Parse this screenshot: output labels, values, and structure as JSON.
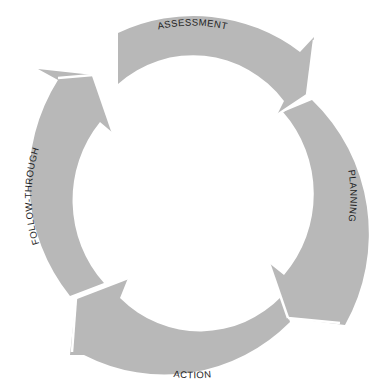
{
  "diagram": {
    "type": "cycle",
    "direction": "clockwise",
    "colors": {
      "segment": "#b8b8b8",
      "background": "#ffffff",
      "text": "#1e1e1e"
    },
    "stages": [
      {
        "id": "assessment",
        "label": "ASSESSMENT",
        "position": "top"
      },
      {
        "id": "planning",
        "label": "PLANNING",
        "position": "right"
      },
      {
        "id": "action",
        "label": "ACTION",
        "position": "bottom"
      },
      {
        "id": "follow-through",
        "label": "FOLLOW-THROUGH",
        "position": "left"
      }
    ]
  }
}
